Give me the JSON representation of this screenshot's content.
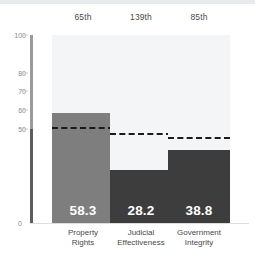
{
  "chart_data": {
    "type": "bar",
    "title": "",
    "xlabel": "",
    "ylabel": "",
    "ylim": [
      0,
      100
    ],
    "grid": false,
    "legend": "none",
    "yticks": [
      100,
      80,
      70,
      60,
      50,
      0
    ],
    "ytick_labels": [
      "100",
      "80",
      "70",
      "60",
      "50",
      "0"
    ],
    "categories": [
      "Property Rights",
      "Judicial Effectiveness",
      "Government Integrity"
    ],
    "category_lines": [
      [
        "Property",
        "Rights"
      ],
      [
        "Judicial",
        "Effectiveness"
      ],
      [
        "Government",
        "Integrity"
      ]
    ],
    "values": [
      58.3,
      28.2,
      38.8
    ],
    "value_labels": [
      "58.3",
      "28.2",
      "38.8"
    ],
    "rank_labels": [
      "65th",
      "139th",
      "85th"
    ],
    "reference_values": [
      50.0,
      47.0,
      44.5
    ],
    "bar_colors": [
      "#7e7e7e",
      "#3d3d3d",
      "#3d3d3d"
    ],
    "track_color": "#f4f5f7",
    "reference_line_color": "#1b1b1b",
    "axis_color": "#9a9a9a",
    "tick_label_color": "#8b8b8b",
    "label_color": "#4a4a4a",
    "value_label_color": "#ffffff"
  }
}
